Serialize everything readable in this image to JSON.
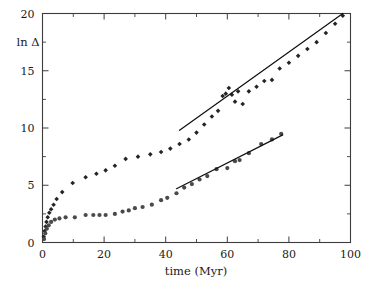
{
  "figure": {
    "background": "#ffffff",
    "frame_color": "#3c3c3c",
    "marker_colors": {
      "diamond": "#242424",
      "circle": "#4a4a4a"
    },
    "fit_line_color": "#111111"
  },
  "axes": {
    "x": {
      "title": "time (Myr)",
      "min": 0,
      "max": 100,
      "major_ticks": [
        0,
        20,
        40,
        60,
        80,
        100
      ],
      "major_tick_labels": [
        "0",
        "20",
        "40",
        "60",
        "80",
        "100"
      ],
      "minor_ticks": [
        10,
        30,
        50,
        70,
        90
      ]
    },
    "y": {
      "title": "ln Δ",
      "min": 0,
      "max": 20,
      "major_ticks": [
        0,
        5,
        10,
        15,
        20
      ],
      "major_tick_labels": [
        "0",
        "5",
        "10",
        "15",
        "20"
      ],
      "minor_ticks": [
        2.5,
        7.5,
        12.5,
        17.5
      ]
    }
  },
  "chart_data": {
    "type": "scatter",
    "title": "",
    "xlabel": "time (Myr)",
    "ylabel": "ln Δ",
    "xlim": [
      0,
      100
    ],
    "ylim": [
      0,
      20
    ],
    "grid": false,
    "legend": null,
    "series": [
      {
        "name": "upper-series",
        "marker": "diamond",
        "color": "#242424",
        "x": [
          0.4,
          0.7,
          1.0,
          1.3,
          1.7,
          2.2,
          2.8,
          3.6,
          4.6,
          6.4,
          9.8,
          14.0,
          17.5,
          20.5,
          23.5,
          27.0,
          31.0,
          35.0,
          38.5,
          41.5,
          44.5,
          47.5,
          50.0,
          52.5,
          55.0,
          57.0,
          58.5,
          59.5,
          60.5,
          61.5,
          62.5,
          63.5,
          65.0,
          67.0,
          69.5,
          72.0,
          74.5,
          77.0,
          80.0,
          83.0,
          86.0,
          89.0,
          92.0,
          95.0,
          97.5
        ],
        "y": [
          0.5,
          1.0,
          1.4,
          1.8,
          2.2,
          2.6,
          2.9,
          3.3,
          3.8,
          4.4,
          5.2,
          5.7,
          6.0,
          6.3,
          6.7,
          7.3,
          7.5,
          7.7,
          7.9,
          8.2,
          8.6,
          9.0,
          9.6,
          10.3,
          11.0,
          11.5,
          12.8,
          13.0,
          13.5,
          12.9,
          12.3,
          13.2,
          12.1,
          13.2,
          13.6,
          14.1,
          14.2,
          15.2,
          15.7,
          16.3,
          16.9,
          17.5,
          18.3,
          19.1,
          19.8
        ]
      },
      {
        "name": "lower-series",
        "marker": "circle",
        "color": "#4a4a4a",
        "x": [
          0.5,
          0.9,
          1.4,
          2.0,
          2.8,
          4.0,
          5.5,
          7.5,
          10.5,
          14.0,
          16.5,
          18.5,
          20.5,
          23.5,
          26.0,
          28.0,
          30.0,
          32.5,
          35.5,
          38.5,
          40.5,
          43.5,
          46.0,
          48.5,
          51.0,
          53.5,
          56.5,
          60.0,
          62.5,
          64.0,
          67.0,
          71.0,
          74.5,
          77.5
        ],
        "y": [
          0.3,
          0.8,
          1.2,
          1.5,
          1.8,
          2.0,
          2.1,
          2.2,
          2.2,
          2.4,
          2.4,
          2.4,
          2.4,
          2.5,
          2.7,
          2.8,
          3.0,
          3.1,
          3.3,
          3.7,
          3.9,
          4.3,
          4.8,
          5.1,
          5.5,
          5.8,
          6.4,
          6.5,
          7.1,
          7.2,
          7.8,
          8.6,
          9.0,
          9.5
        ]
      }
    ],
    "fit_lines": [
      {
        "name": "upper-fit-line",
        "series": "upper-series",
        "x_start": 44.5,
        "y_start": 9.8,
        "x_end": 97.5,
        "y_end": 20.0
      },
      {
        "name": "lower-fit-line",
        "series": "lower-series",
        "x_start": 43.5,
        "y_start": 4.7,
        "x_end": 78.0,
        "y_end": 9.4
      }
    ]
  }
}
